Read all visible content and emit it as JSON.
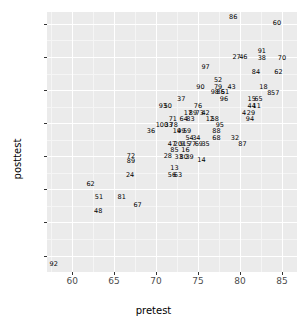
{
  "chart_data": {
    "type": "scatter",
    "title": "",
    "xlabel": "pretest",
    "ylabel": "posttest",
    "xlim": [
      57.0,
      86.8
    ],
    "ylim": [
      57.5,
      96.8
    ],
    "xticks": [
      60,
      65,
      70,
      75,
      80,
      85
    ],
    "yticks": [
      60,
      65,
      70,
      75,
      80,
      85,
      90,
      95
    ],
    "grid": true,
    "legend": "none",
    "point_marker": "text-label",
    "panel_background": "#ebebeb",
    "gridline_color": "#ffffff",
    "text_color": "#000000",
    "points": [
      {
        "label": "86",
        "x": 79.2,
        "y": 96.0
      },
      {
        "label": "60",
        "x": 84.4,
        "y": 95.2
      },
      {
        "label": "91",
        "x": 82.6,
        "y": 90.9
      },
      {
        "label": "27",
        "x": 79.6,
        "y": 90.0
      },
      {
        "label": "46",
        "x": 80.4,
        "y": 90.0
      },
      {
        "label": "38",
        "x": 82.6,
        "y": 89.9
      },
      {
        "label": "70",
        "x": 85.0,
        "y": 89.9
      },
      {
        "label": "97",
        "x": 75.9,
        "y": 88.5
      },
      {
        "label": "84",
        "x": 81.9,
        "y": 87.8
      },
      {
        "label": "62",
        "x": 84.6,
        "y": 87.7
      },
      {
        "label": "52",
        "x": 77.4,
        "y": 86.6
      },
      {
        "label": "90",
        "x": 75.3,
        "y": 85.5
      },
      {
        "label": "79",
        "x": 77.4,
        "y": 85.5
      },
      {
        "label": "43",
        "x": 79.0,
        "y": 85.5
      },
      {
        "label": "18",
        "x": 82.8,
        "y": 85.4
      },
      {
        "label": "98",
        "x": 77.0,
        "y": 84.7
      },
      {
        "label": "85",
        "x": 77.7,
        "y": 84.7
      },
      {
        "label": "61",
        "x": 78.2,
        "y": 84.7
      },
      {
        "label": "8",
        "x": 83.5,
        "y": 84.6
      },
      {
        "label": "57",
        "x": 84.2,
        "y": 84.6
      },
      {
        "label": "37",
        "x": 73.0,
        "y": 83.6
      },
      {
        "label": "96",
        "x": 78.1,
        "y": 83.6
      },
      {
        "label": "15",
        "x": 81.4,
        "y": 83.6
      },
      {
        "label": "65",
        "x": 82.2,
        "y": 83.6
      },
      {
        "label": "93",
        "x": 70.8,
        "y": 82.6
      },
      {
        "label": "50",
        "x": 71.4,
        "y": 82.6
      },
      {
        "label": "76",
        "x": 75.0,
        "y": 82.6
      },
      {
        "label": "44",
        "x": 81.4,
        "y": 82.6
      },
      {
        "label": "11",
        "x": 82.0,
        "y": 82.6
      },
      {
        "label": "17",
        "x": 73.8,
        "y": 81.6
      },
      {
        "label": "89",
        "x": 74.4,
        "y": 81.6
      },
      {
        "label": "73",
        "x": 75.2,
        "y": 81.6
      },
      {
        "label": "42",
        "x": 75.9,
        "y": 81.6
      },
      {
        "label": "4",
        "x": 80.5,
        "y": 81.6
      },
      {
        "label": "29",
        "x": 81.3,
        "y": 81.6
      },
      {
        "label": "71",
        "x": 72.0,
        "y": 80.7
      },
      {
        "label": "64",
        "x": 73.3,
        "y": 80.7
      },
      {
        "label": "83",
        "x": 74.1,
        "y": 80.7
      },
      {
        "label": "12",
        "x": 76.4,
        "y": 80.7
      },
      {
        "label": "58",
        "x": 77.0,
        "y": 80.7
      },
      {
        "label": "94",
        "x": 81.2,
        "y": 80.7
      },
      {
        "label": "100",
        "x": 70.7,
        "y": 79.7
      },
      {
        "label": "33",
        "x": 71.5,
        "y": 79.7
      },
      {
        "label": "78",
        "x": 72.1,
        "y": 79.7
      },
      {
        "label": "95",
        "x": 77.6,
        "y": 79.7
      },
      {
        "label": "36",
        "x": 69.4,
        "y": 78.8
      },
      {
        "label": "19",
        "x": 72.5,
        "y": 78.8
      },
      {
        "label": "49",
        "x": 73.0,
        "y": 78.8
      },
      {
        "label": "59",
        "x": 73.7,
        "y": 78.8
      },
      {
        "label": "88",
        "x": 77.2,
        "y": 78.8
      },
      {
        "label": "54",
        "x": 74.0,
        "y": 77.8
      },
      {
        "label": "34",
        "x": 74.8,
        "y": 77.8
      },
      {
        "label": "68",
        "x": 77.2,
        "y": 77.8
      },
      {
        "label": "32",
        "x": 79.4,
        "y": 77.8
      },
      {
        "label": "47",
        "x": 71.9,
        "y": 76.8
      },
      {
        "label": "20",
        "x": 72.6,
        "y": 76.8
      },
      {
        "label": "9",
        "x": 73.1,
        "y": 76.8
      },
      {
        "label": "15",
        "x": 73.6,
        "y": 76.8
      },
      {
        "label": "77",
        "x": 74.3,
        "y": 76.8
      },
      {
        "label": "69",
        "x": 75.1,
        "y": 76.8
      },
      {
        "label": "35",
        "x": 75.9,
        "y": 76.8
      },
      {
        "label": "87",
        "x": 80.3,
        "y": 76.8
      },
      {
        "label": "85",
        "x": 72.2,
        "y": 75.9
      },
      {
        "label": "16",
        "x": 73.5,
        "y": 75.9
      },
      {
        "label": "72",
        "x": 67.0,
        "y": 75.1
      },
      {
        "label": "28",
        "x": 71.4,
        "y": 75.0
      },
      {
        "label": "33",
        "x": 72.7,
        "y": 74.9
      },
      {
        "label": "80",
        "x": 73.3,
        "y": 74.9
      },
      {
        "label": "39",
        "x": 74.0,
        "y": 74.9
      },
      {
        "label": "14",
        "x": 75.4,
        "y": 74.5
      },
      {
        "label": "89",
        "x": 67.0,
        "y": 74.3
      },
      {
        "label": "13",
        "x": 72.2,
        "y": 73.2
      },
      {
        "label": "24",
        "x": 66.9,
        "y": 72.2
      },
      {
        "label": "56",
        "x": 71.9,
        "y": 72.1
      },
      {
        "label": "63",
        "x": 72.6,
        "y": 72.1
      },
      {
        "label": "62",
        "x": 62.2,
        "y": 70.8
      },
      {
        "label": "51",
        "x": 63.2,
        "y": 68.8
      },
      {
        "label": "81",
        "x": 65.9,
        "y": 68.8
      },
      {
        "label": "67",
        "x": 67.8,
        "y": 67.7
      },
      {
        "label": "48",
        "x": 63.1,
        "y": 66.8
      },
      {
        "label": "92",
        "x": 57.8,
        "y": 58.7
      }
    ]
  }
}
